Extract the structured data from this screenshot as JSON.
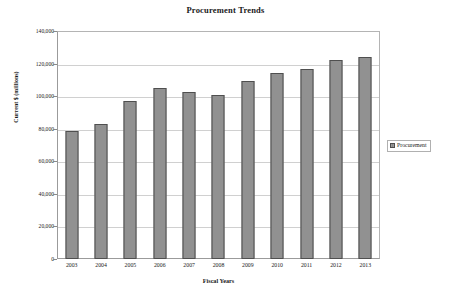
{
  "chart_data": {
    "type": "bar",
    "title": "Procurement Trends",
    "xlabel": "Fiscal Years",
    "ylabel": "Current $ (millions)",
    "categories": [
      "2003",
      "2004",
      "2005",
      "2006",
      "2007",
      "2008",
      "2009",
      "2010",
      "2011",
      "2012",
      "2013"
    ],
    "values": [
      78600,
      82900,
      97000,
      105000,
      102500,
      101000,
      109500,
      114000,
      116700,
      122500,
      124000
    ],
    "series": [
      {
        "name": "Procurement",
        "values": [
          78600,
          82900,
          97000,
          105000,
          102500,
          101000,
          109500,
          114000,
          116700,
          122500,
          124000
        ]
      }
    ],
    "ylim": [
      0,
      140000
    ],
    "ytick_values": [
      0,
      20000,
      40000,
      60000,
      80000,
      100000,
      120000,
      140000
    ],
    "ytick_labels": [
      "0",
      "20,000",
      "40,000",
      "60,000",
      "80,000",
      "100,000",
      "120,000",
      "140,000"
    ],
    "grid": true,
    "legend_position": "right",
    "bar_color": "#8e8e8e",
    "bar_border_color": "#4f4f4f",
    "grid_color": "#d0d0d0",
    "axis_color": "#9b9b9b",
    "background_color": "#ffffff"
  },
  "legend": {
    "entries": [
      {
        "label": "Procurement",
        "color": "#8e8e8e"
      }
    ]
  }
}
